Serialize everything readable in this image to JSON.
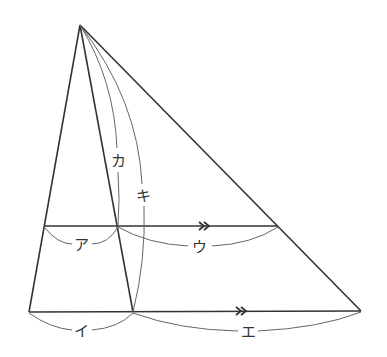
{
  "diagram": {
    "type": "geometry",
    "points": {
      "apex": [
        80,
        25
      ],
      "upper_left": [
        44,
        226
      ],
      "upper_mid": [
        118,
        226
      ],
      "upper_right": [
        278,
        226
      ],
      "lower_left": [
        29,
        312
      ],
      "lower_mid": [
        133,
        312
      ],
      "lower_right": [
        361,
        311
      ]
    },
    "parallel_marker": "»",
    "labels": {
      "a": "ア",
      "i": "イ",
      "u": "ウ",
      "e": "エ",
      "ka": "カ",
      "ki": "キ"
    },
    "colors": {
      "line": "#333333",
      "arc": "#666666"
    }
  }
}
